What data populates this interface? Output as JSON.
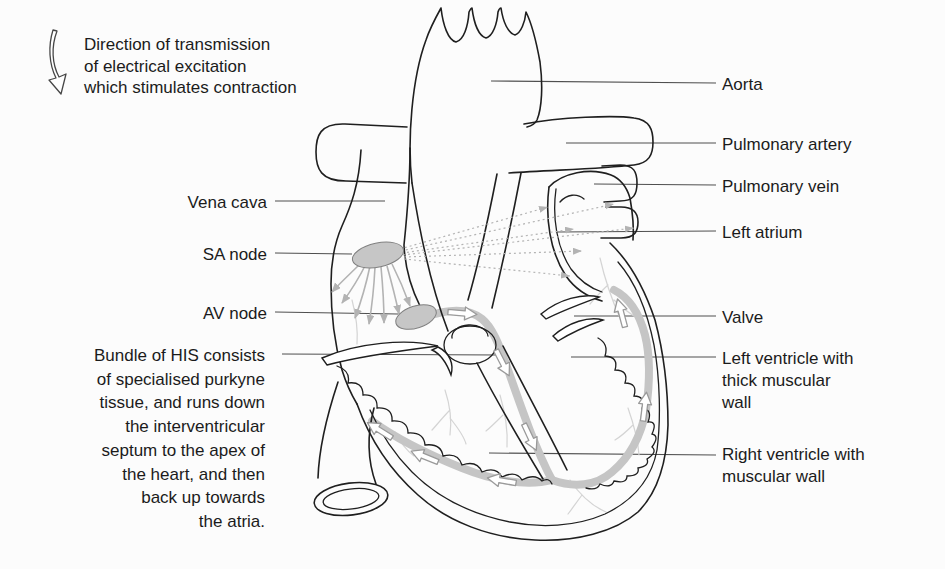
{
  "figure": {
    "type": "anatomical-diagram",
    "note": {
      "lines": [
        "Direction of transmission",
        "of electrical excitation",
        "which stimulates contraction"
      ]
    },
    "labels_left": [
      {
        "id": "vena-cava",
        "lines": [
          "Vena cava"
        ]
      },
      {
        "id": "sa-node",
        "lines": [
          "SA node"
        ]
      },
      {
        "id": "av-node",
        "lines": [
          "AV node"
        ]
      }
    ],
    "bundle_caption": {
      "lines": [
        "Bundle of HIS consists",
        "of specialised purkyne",
        "tissue, and runs down",
        "the interventricular",
        "septum to the apex of",
        "the heart, and then",
        "back up towards",
        "the atria."
      ]
    },
    "labels_right": [
      {
        "id": "aorta",
        "lines": [
          "Aorta"
        ]
      },
      {
        "id": "pulmonary-artery",
        "lines": [
          "Pulmonary artery"
        ]
      },
      {
        "id": "pulmonary-vein",
        "lines": [
          "Pulmonary vein"
        ]
      },
      {
        "id": "left-atrium",
        "lines": [
          "Left atrium"
        ]
      },
      {
        "id": "valve",
        "lines": [
          "Valve"
        ]
      },
      {
        "id": "left-ventricle",
        "lines": [
          "Left ventricle with",
          "thick muscular",
          "wall"
        ]
      },
      {
        "id": "right-ventricle",
        "lines": [
          "Right ventricle with",
          "muscular wall"
        ]
      }
    ],
    "icons": {
      "direction_arrow": "curved-down-arrow"
    }
  },
  "colors": {
    "line": "#1f1f1f",
    "leader": "#4f4f4f",
    "conduction_band": "#c5c5c5",
    "node_fill": "#c6c6c6",
    "node_stroke": "#808080",
    "transmission_gray": "#b3b3b3",
    "purkinje": "#d4d4d4",
    "background": "#fcfcfc",
    "text": "#1b1b1b"
  }
}
